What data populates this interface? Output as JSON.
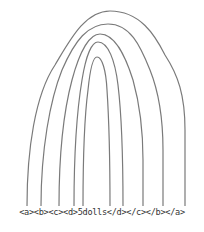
{
  "diagram": {
    "type": "nested-tag-arcs",
    "label": "<a><b><c><d>5dolls</d></c></b></a>",
    "pairs": [
      {
        "name": "a",
        "open": "<a>",
        "close": "</a>"
      },
      {
        "name": "b",
        "open": "<b>",
        "close": "</b>"
      },
      {
        "name": "c",
        "open": "<c>",
        "close": "</c>"
      },
      {
        "name": "d",
        "open": "<d>",
        "close": "</d>"
      },
      {
        "name": "content",
        "open": "5",
        "close": "s"
      }
    ],
    "stroke_color": "#7a7a7a"
  }
}
